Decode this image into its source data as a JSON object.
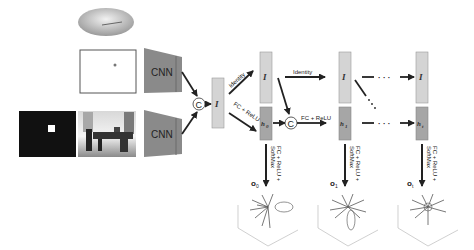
{
  "diagram": {
    "type": "recurrent-network-architecture",
    "inputs": {
      "disc_image": "ellipse-disc",
      "position_map": "white-frame-with-dot",
      "mask_image": "black-frame-with-white-square",
      "scene_image": "indoor-room-photo"
    },
    "encoders": [
      {
        "label": "CNN"
      },
      {
        "label": "CNN"
      }
    ],
    "concat_symbol": "C",
    "feature_label": "I",
    "edges": {
      "identity": "Identity",
      "fc_relu": "FC + ReLU",
      "output_fc": "FC + ReLU +",
      "output_softmax": "SoftMax"
    },
    "hidden_states": [
      {
        "label": "h",
        "sub": "0"
      },
      {
        "label": "h",
        "sub": "1"
      },
      {
        "label": "h",
        "sub": "t"
      }
    ],
    "outputs": [
      {
        "label": "o",
        "sub": "0"
      },
      {
        "label": "o",
        "sub": "1"
      },
      {
        "label": "o",
        "sub": "t"
      }
    ],
    "ellipsis": "· · ·",
    "colors": {
      "cnn": "#8a8a8a",
      "feature_box": "#d4d4d4",
      "hidden_box": "#a6a6a6",
      "arrow": "#222222"
    }
  }
}
